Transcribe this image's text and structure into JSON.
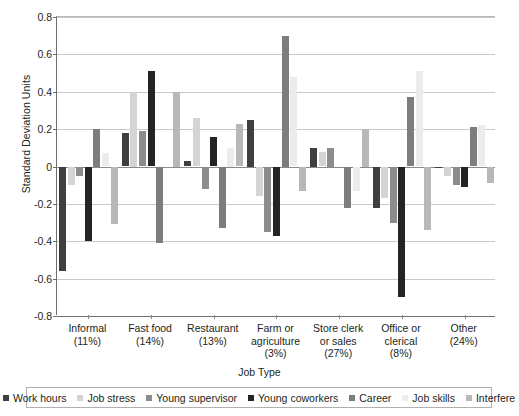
{
  "chart_data": {
    "type": "bar",
    "title": "",
    "xlabel": "Job Type",
    "ylabel": "Standard Deviation Units",
    "ylim": [
      -0.8,
      0.8
    ],
    "ytick_step": 0.2,
    "yticks": [
      "0.8",
      "0.6",
      "0.4",
      "0.2",
      "0",
      "-0.2",
      "-0.4",
      "-0.6",
      "-0.8"
    ],
    "ytick_values": [
      0.8,
      0.6,
      0.4,
      0.2,
      0,
      -0.2,
      -0.4,
      -0.6,
      -0.8
    ],
    "grid": true,
    "legend_position": "bottom",
    "categories": [
      "Informal\n(11%)",
      "Fast food\n(14%)",
      "Restaurant\n(13%)",
      "Farm or\nagriculture\n(3%)",
      "Store clerk\nor sales\n(27%)",
      "Office or\nclerical\n(8%)",
      "Other\n(24%)"
    ],
    "category_lines": [
      [
        "Informal",
        "(11%)"
      ],
      [
        "Fast food",
        "(14%)"
      ],
      [
        "Restaurant",
        "(13%)"
      ],
      [
        "Farm or",
        "agriculture",
        "(3%)"
      ],
      [
        "Store clerk",
        "or sales",
        "(27%)"
      ],
      [
        "Office or",
        "clerical",
        "(8%)"
      ],
      [
        "Other",
        "(24%)"
      ]
    ],
    "series": [
      {
        "name": "Work hours",
        "color": "#3f3f3f",
        "values": [
          -0.56,
          0.18,
          0.03,
          0.25,
          0.1,
          -0.22,
          -0.01
        ]
      },
      {
        "name": "Job stress",
        "color": "#d4d4d4",
        "values": [
          -0.1,
          0.4,
          0.26,
          -0.16,
          0.08,
          -0.17,
          -0.05
        ]
      },
      {
        "name": "Young supervisor",
        "color": "#8c8c8c",
        "values": [
          -0.05,
          0.19,
          -0.12,
          -0.35,
          0.1,
          -0.3,
          -0.1
        ]
      },
      {
        "name": "Young coworkers",
        "color": "#242424",
        "values": [
          -0.4,
          0.51,
          0.16,
          -0.37,
          0.0,
          -0.7,
          -0.11
        ]
      },
      {
        "name": "Career",
        "color": "#7d7d7d",
        "values": [
          0.2,
          -0.41,
          -0.33,
          0.7,
          -0.22,
          0.37,
          0.21
        ]
      },
      {
        "name": "Job skills",
        "color": "#ececec",
        "values": [
          0.07,
          0.0,
          0.1,
          0.48,
          -0.13,
          0.51,
          0.22
        ]
      },
      {
        "name": "Interfere",
        "color": "#b8b8b8",
        "values": [
          -0.31,
          0.4,
          0.23,
          -0.13,
          0.2,
          -0.34,
          -0.09
        ]
      }
    ]
  }
}
